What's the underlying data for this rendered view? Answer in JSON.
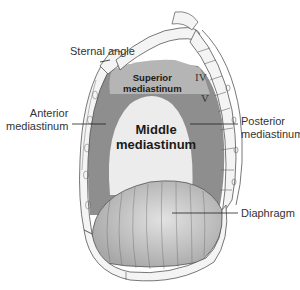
{
  "diagram": {
    "labels": {
      "sternal_angle": "Sternal angle",
      "superior_line1": "Superior",
      "superior_line2": "mediastinum",
      "anterior_line1": "Anterior",
      "anterior_line2": "mediastinum",
      "middle_line1": "Middle",
      "middle_line2": "mediastinum",
      "posterior_line1": "Posterior",
      "posterior_line2": "mediastinum",
      "diaphragm": "Diaphragm",
      "vertebra_iv": "IV",
      "vertebra_v": "V"
    },
    "colors": {
      "superior": "#b5b5b5",
      "anterior_posterior": "#8e8e8e",
      "middle": "#ececec",
      "diaphragm": "#c8c8c8",
      "bone": "#f4f4f4",
      "outline": "#555555",
      "leader": "#222222"
    }
  }
}
